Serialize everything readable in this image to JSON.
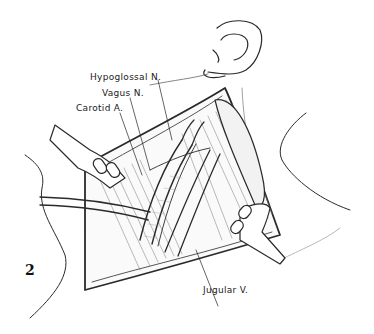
{
  "figure": {
    "number": "2"
  },
  "labels": {
    "hypoglossal": "Hypoglossal N.",
    "vagus": "Vagus N.",
    "carotid": "Carotid A.",
    "jugular": "Jugular V."
  },
  "colors": {
    "ink": "#2a2a2a",
    "background": "#ffffff"
  }
}
